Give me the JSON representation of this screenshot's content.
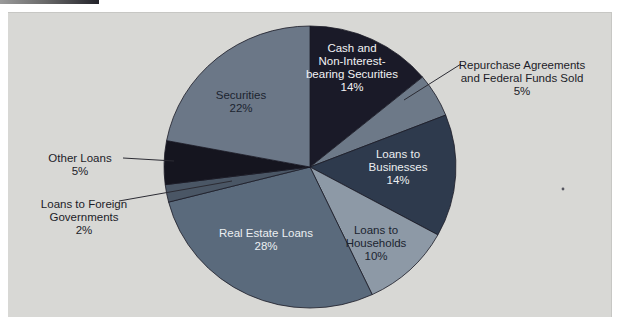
{
  "figure": {
    "background_color": "#ffffff",
    "panel_color": "#d8d8d5",
    "top_bar_colors": [
      "#9a9a9a",
      "#23232a"
    ],
    "stray_mark": {
      "x": 563,
      "y": 189,
      "color": "#55555f"
    }
  },
  "chart_data": {
    "type": "pie",
    "title": "",
    "unit": "%",
    "legend": "none",
    "center": [
      310,
      167
    ],
    "radius": [
      146,
      141
    ],
    "start_angle_deg": -90,
    "direction": "clockwise",
    "stroke_color": "#1a1a26",
    "label_font_size": 11.5,
    "label_line_height": 13,
    "categories": [
      "Cash and Non-Interest-bearing Securities",
      "Repurchase Agreements and Federal Funds Sold",
      "Loans to Businesses",
      "Loans to Households",
      "Real Estate Loans",
      "Loans to Foreign Governments",
      "Other Loans",
      "Securities"
    ],
    "values": [
      14,
      5,
      14,
      10,
      28,
      2,
      5,
      22
    ],
    "slices": [
      {
        "label": "Cash and Non-Interest-bearing Securities",
        "value": 14,
        "color": "#1a1a28",
        "label_lines": [
          "Cash and",
          "Non-Interest-",
          "bearing Securities",
          "14%"
        ],
        "label_pos": [
          352,
          52
        ],
        "label_color": "#f2f2f4",
        "placement": "inside"
      },
      {
        "label": "Repurchase Agreements and Federal Funds Sold",
        "value": 5,
        "color": "#6d7988",
        "label_lines": [
          "Repurchase Agreements",
          "and Federal Funds Sold",
          "5%"
        ],
        "label_pos": [
          522,
          69
        ],
        "label_color": "#1c1c28",
        "placement": "outside",
        "leader": [
          461,
          64,
          404,
          100
        ]
      },
      {
        "label": "Loans to Businesses",
        "value": 14,
        "color": "#2e3a4d",
        "label_lines": [
          "Loans to",
          "Businesses",
          "14%"
        ],
        "label_pos": [
          398,
          158
        ],
        "label_color": "#eceef0",
        "placement": "inside"
      },
      {
        "label": "Loans to Households",
        "value": 10,
        "color": "#8d99a6",
        "label_lines": [
          "Loans to",
          "Households",
          "10%"
        ],
        "label_pos": [
          376,
          234
        ],
        "label_color": "#1b2430",
        "placement": "inside"
      },
      {
        "label": "Real Estate Loans",
        "value": 28,
        "color": "#5a6a7c",
        "label_lines": [
          "Real Estate Loans",
          "28%"
        ],
        "label_pos": [
          266,
          237
        ],
        "label_color": "#eceff2",
        "placement": "inside"
      },
      {
        "label": "Loans to Foreign Governments",
        "value": 2,
        "color": "#4a5665",
        "label_lines": [
          "Loans to Foreign",
          "Governments",
          "2%"
        ],
        "label_pos": [
          84,
          208
        ],
        "label_color": "#1c1c28",
        "placement": "outside",
        "leader": [
          119,
          201,
          232,
          181
        ]
      },
      {
        "label": "Other Loans",
        "value": 5,
        "color": "#15151f",
        "label_lines": [
          "Other Loans",
          "5%"
        ],
        "label_pos": [
          80,
          162
        ],
        "label_color": "#1c1c28",
        "placement": "outside",
        "leader": [
          123,
          158,
          174,
          161
        ]
      },
      {
        "label": "Securities",
        "value": 22,
        "color": "#6b7787",
        "label_lines": [
          "Securities",
          "22%"
        ],
        "label_pos": [
          241,
          99
        ],
        "label_color": "#1b2430",
        "placement": "inside"
      }
    ]
  }
}
